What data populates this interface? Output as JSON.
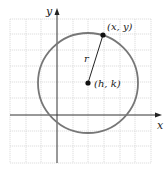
{
  "diagram": {
    "type": "circle-standard-form",
    "axes": {
      "x_label": "x",
      "y_label": "y",
      "origin_px": [
        57,
        115
      ]
    },
    "grid": {
      "x_lines": [
        10,
        26,
        41,
        57,
        73,
        88,
        104,
        120,
        135,
        151
      ],
      "y_lines": [
        19,
        34,
        50,
        66,
        82,
        98,
        115,
        131,
        146,
        163
      ],
      "color": "#d6d6d6"
    },
    "circle": {
      "center_px": [
        88,
        83
      ],
      "radius_px": 50,
      "stroke": "#777777"
    },
    "center_point": {
      "label": "(h, k)",
      "px": [
        88,
        83
      ]
    },
    "circle_point": {
      "label": "(x, y)",
      "px": [
        103,
        35
      ]
    },
    "radius_label": "r"
  }
}
